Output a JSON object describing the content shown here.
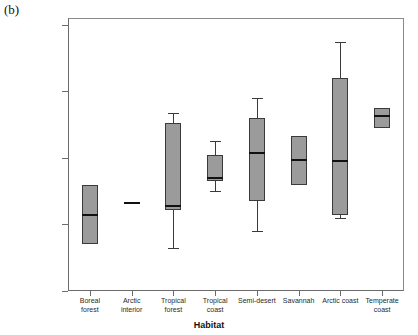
{
  "panel_label": "(b)",
  "chart_data": {
    "type": "box",
    "title": "",
    "subtitle": "",
    "xlabel": "Habitat",
    "ylabel": "Band Size",
    "ylim": [
      0,
      85
    ],
    "ytick_values": [
      0,
      20,
      40,
      60,
      80
    ],
    "ytick_labels": [
      ".00",
      "20.00",
      "40.00",
      "60.00",
      "80.00"
    ],
    "grid": false,
    "legend": "none",
    "categories": [
      "Boreal forest",
      "Arctic interior",
      "Tropical forest",
      "Tropical coast",
      "Semi-desert",
      "Savannah",
      "Arctic coast",
      "Temperate coast"
    ],
    "category_lines": [
      [
        "Boreal",
        "forest"
      ],
      [
        "Arctic",
        "interior"
      ],
      [
        "Tropical",
        "forest"
      ],
      [
        "Tropical",
        "coast"
      ],
      [
        "Semi-desert",
        ""
      ],
      [
        "Savannah",
        ""
      ],
      [
        "Arctic coast",
        ""
      ],
      [
        "Temperate",
        "coast"
      ]
    ],
    "boxes": [
      {
        "category": "Boreal forest",
        "whisker_low": 14.0,
        "q1": 14.0,
        "median": 23.0,
        "q3": 32.0,
        "whisker_high": 32.0,
        "degenerate": false
      },
      {
        "category": "Arctic interior",
        "whisker_low": 26.7,
        "q1": 26.7,
        "median": 26.7,
        "q3": 26.7,
        "whisker_high": 26.7,
        "degenerate": true
      },
      {
        "category": "Tropical forest",
        "whisker_low": 13.0,
        "q1": 24.5,
        "median": 25.5,
        "q3": 50.4,
        "whisker_high": 53.4,
        "degenerate": false
      },
      {
        "category": "Tropical coast",
        "whisker_low": 30.0,
        "q1": 33.0,
        "median": 34.0,
        "q3": 41.0,
        "whisker_high": 45.0,
        "degenerate": false
      },
      {
        "category": "Semi-desert",
        "whisker_low": 18.0,
        "q1": 27.0,
        "median": 41.5,
        "q3": 52.0,
        "whisker_high": 58.0,
        "degenerate": false
      },
      {
        "category": "Savannah",
        "whisker_low": 32.0,
        "q1": 32.0,
        "median": 39.5,
        "q3": 46.5,
        "whisker_high": 46.5,
        "degenerate": false
      },
      {
        "category": "Arctic coast",
        "whisker_low": 22.0,
        "q1": 23.0,
        "median": 39.0,
        "q3": 64.0,
        "whisker_high": 75.0,
        "degenerate": false
      },
      {
        "category": "Temperate coast",
        "whisker_low": 49.0,
        "q1": 49.0,
        "median": 52.5,
        "q3": 55.0,
        "whisker_high": 55.0,
        "degenerate": false
      }
    ],
    "colors": {
      "box_fill": "#9b9b9b",
      "box_edge": "#3a3a3a",
      "median": "#111111",
      "axis": "#6b6b6b",
      "text": "#2a2a2a"
    }
  }
}
